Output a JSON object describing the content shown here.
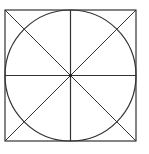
{
  "diagram": {
    "type": "geometric-figure",
    "stroke_color": "#333333",
    "background": "#ffffff",
    "square": {
      "x": 5,
      "y": 10,
      "size": 131
    },
    "circle": {
      "cx": 70.5,
      "cy": 75.5,
      "r": 65.5
    },
    "center_point": {
      "cx": 70.5,
      "cy": 75.5
    }
  }
}
